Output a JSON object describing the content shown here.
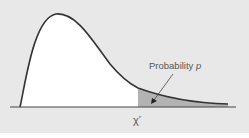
{
  "diagram": {
    "type": "chi-square distribution right tail",
    "annotation": {
      "text": "Probability ",
      "variable": "p"
    },
    "critical_value_label": {
      "symbol": "χ",
      "superscript": "*"
    },
    "colors": {
      "background": "#e8e8e8",
      "curve_fill": "#ffffff",
      "tail_fill": "#b3b3b3",
      "curve_stroke": "#333333",
      "axis": "#444444",
      "text": "#555555"
    }
  }
}
